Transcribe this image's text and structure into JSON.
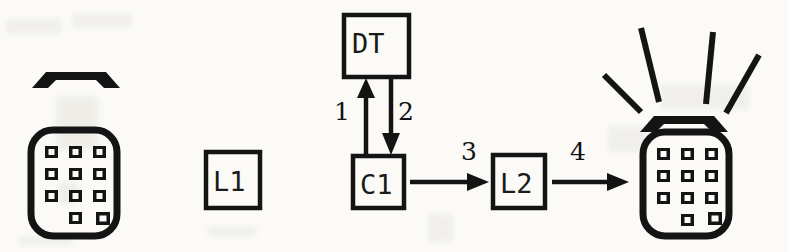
{
  "diagram": {
    "background_color": "#fbfaf7",
    "ink_color": "#141414",
    "nodes": [
      {
        "id": "phone-caller",
        "type": "telephone-icon",
        "state": "idle",
        "x": 28,
        "y": 68,
        "width": 92,
        "height": 168
      },
      {
        "id": "L1",
        "type": "box",
        "label": "L1",
        "x": 206,
        "y": 152,
        "width": 54,
        "height": 56
      },
      {
        "id": "DT",
        "type": "box",
        "label": "DT",
        "x": 344,
        "y": 15,
        "width": 65,
        "height": 62
      },
      {
        "id": "C1",
        "type": "box",
        "label": "C1",
        "x": 353,
        "y": 156,
        "width": 51,
        "height": 52
      },
      {
        "id": "L2",
        "type": "box",
        "label": "L2",
        "x": 493,
        "y": 155,
        "width": 52,
        "height": 53
      },
      {
        "id": "phone-callee",
        "type": "telephone-icon",
        "state": "ringing",
        "x": 630,
        "y": 20,
        "width": 140,
        "height": 216,
        "ring_lines": 4
      }
    ],
    "edges": [
      {
        "id": "edge-1",
        "label": "1",
        "from": "C1",
        "to": "DT",
        "direction": "up",
        "label_x": 338,
        "label_y": 98
      },
      {
        "id": "edge-2",
        "label": "2",
        "from": "DT",
        "to": "C1",
        "direction": "down",
        "label_x": 398,
        "label_y": 98
      },
      {
        "id": "edge-3",
        "label": "3",
        "from": "C1",
        "to": "L2",
        "direction": "right",
        "label_x": 462,
        "label_y": 140
      },
      {
        "id": "edge-4",
        "label": "4",
        "from": "L2",
        "to": "phone-callee",
        "direction": "right",
        "label_x": 572,
        "label_y": 140
      }
    ]
  }
}
